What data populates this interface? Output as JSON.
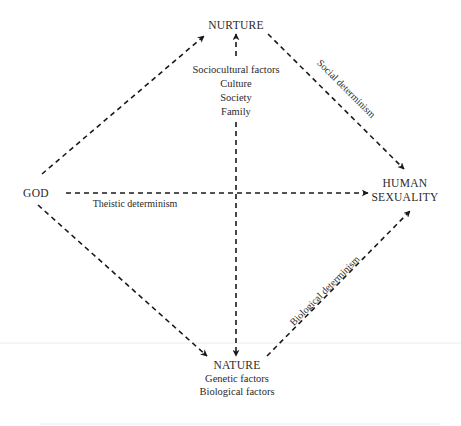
{
  "diagram": {
    "type": "directed-graph",
    "style": {
      "line_color": "#1a1a1a",
      "text_color": "#2a2a2a",
      "background": "#ffffff",
      "edge_style": "dashed"
    },
    "nodes": {
      "god": {
        "label": "GOD"
      },
      "nurture": {
        "label": "NURTURE",
        "details": [
          "Sociocultural factors",
          "Culture",
          "Society",
          "Family"
        ]
      },
      "nature": {
        "label": "NATURE",
        "details": [
          "Genetic factors",
          "Biological factors"
        ]
      },
      "human_sexuality": {
        "label_line1": "HUMAN",
        "label_line2": "SEXUALITY"
      }
    },
    "edges": [
      {
        "from": "GOD",
        "to": "NURTURE",
        "label": ""
      },
      {
        "from": "GOD",
        "to": "NATURE",
        "label": ""
      },
      {
        "from": "GOD",
        "to": "HUMAN SEXUALITY",
        "label": "Theistic determinism"
      },
      {
        "from": "NURTURE",
        "to": "HUMAN SEXUALITY",
        "label": "Social determinism"
      },
      {
        "from": "NATURE",
        "to": "HUMAN SEXUALITY",
        "label": "Biological determinism"
      },
      {
        "from": "NURTURE",
        "to": "NATURE",
        "label": "",
        "bidirectional": true
      }
    ],
    "edge_labels": {
      "theistic": "Theistic determinism",
      "social": "Social determinism",
      "biological": "Biological determinism"
    }
  }
}
